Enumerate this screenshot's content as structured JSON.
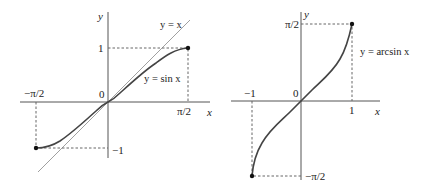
{
  "left_graph": {
    "y_axis_label": "y",
    "x_axis_label": "x",
    "origin_label": "0",
    "line_label": "y = x",
    "curve_label": "y = sin x",
    "tick_y_pos": "1",
    "tick_y_neg": "−1",
    "tick_x_pos": "π/2",
    "tick_x_neg": "−π/2"
  },
  "right_graph": {
    "y_axis_label": "y",
    "x_axis_label": "x",
    "origin_label": "0",
    "curve_label": "y = arcsin x",
    "tick_y_pos": "π/2",
    "tick_y_neg": "−π/2",
    "tick_x_pos": "1",
    "tick_x_neg": "−1"
  },
  "colors": {
    "curve": "#444444",
    "axis": "#555555",
    "background": "#ffffff"
  }
}
